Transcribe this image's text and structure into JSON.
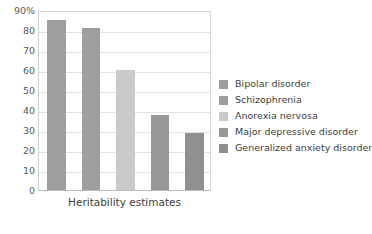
{
  "chart_data": {
    "type": "bar",
    "title": "",
    "xlabel": "Heritability estimates",
    "ylabel": "",
    "ylim": [
      0,
      90
    ],
    "grid": true,
    "legend_position": "right",
    "categories": [
      "Bipolar disorder",
      "Schizophrenia",
      "Anorexia nervosa",
      "Major depressive disorder",
      "Generalized anxiety disorder"
    ],
    "values": [
      85,
      81,
      60,
      37.5,
      28.5
    ],
    "colors": [
      "#9e9e9e",
      "#9e9e9e",
      "#cacaca",
      "#979797",
      "#909090"
    ],
    "ytick_labels": [
      "90%",
      "80",
      "70",
      "60",
      "50",
      "40",
      "30",
      "20",
      "10",
      "0"
    ],
    "ytick_values": [
      90,
      80,
      70,
      60,
      50,
      40,
      30,
      20,
      10,
      0
    ]
  },
  "legend": {
    "items": [
      {
        "label": "Bipolar disorder",
        "color": "#9e9e9e"
      },
      {
        "label": "Schizophrenia",
        "color": "#9e9e9e"
      },
      {
        "label": "Anorexia nervosa",
        "color": "#cacaca"
      },
      {
        "label": "Major depressive disorder",
        "color": "#979797"
      },
      {
        "label": "Generalized anxiety disorder",
        "color": "#909090"
      }
    ]
  }
}
